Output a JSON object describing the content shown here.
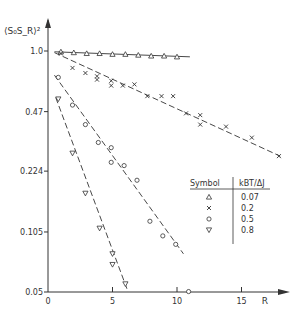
{
  "chart_data": {
    "type": "scatter",
    "title": "",
    "xlabel": "R",
    "ylabel": "<S0SR>^2",
    "ylabel_display": "⟨S₀S_R⟩²",
    "yscale": "log",
    "xlim": [
      0,
      18
    ],
    "ylim": [
      0.05,
      1.2
    ],
    "xticks": [
      0,
      5,
      10,
      15
    ],
    "yticks": [
      1.0,
      0.47,
      0.224,
      0.105,
      0.05
    ],
    "ytick_labels": [
      "1.0",
      "0.47",
      "0.224",
      "0.105",
      "0.05"
    ],
    "grid": false,
    "legend": {
      "position": "lower right",
      "header_symbol": "Symbol",
      "header_value": "kBT/ΔJ",
      "entries": [
        {
          "symbol": "△",
          "marker": "triangle-up",
          "value": "0.07"
        },
        {
          "symbol": "×",
          "marker": "x",
          "value": "0.2"
        },
        {
          "symbol": "○",
          "marker": "circle",
          "value": "0.5"
        },
        {
          "symbol": "▽",
          "marker": "triangle-down",
          "value": "0.8"
        }
      ]
    },
    "series": [
      {
        "name": "0.07",
        "marker": "triangle-up",
        "line": "solid",
        "x": [
          1,
          2,
          3,
          4,
          5,
          6,
          7,
          8,
          9,
          10
        ],
        "y": [
          0.99,
          0.98,
          0.97,
          0.97,
          0.96,
          0.96,
          0.95,
          0.94,
          0.94,
          0.93
        ],
        "fit": {
          "x": [
            0.5,
            11
          ],
          "y": [
            0.99,
            0.93
          ]
        }
      },
      {
        "name": "0.2",
        "marker": "x",
        "line": "dashed",
        "x": [
          1,
          1.9,
          2.9,
          3.8,
          3.8,
          4.9,
          4.9,
          5.8,
          6.7,
          7.7,
          8.8,
          9.7,
          10.7,
          11.8,
          11.8,
          13.8,
          15.8,
          17.9
        ],
        "y": [
          0.97,
          0.81,
          0.76,
          0.73,
          0.7,
          0.69,
          0.65,
          0.65,
          0.66,
          0.57,
          0.57,
          0.57,
          0.46,
          0.45,
          0.4,
          0.39,
          0.34,
          0.27
        ],
        "fit": {
          "x": [
            0.5,
            18
          ],
          "y": [
            0.98,
            0.27
          ]
        }
      },
      {
        "name": "0.5",
        "marker": "circle",
        "line": "dashed",
        "x": [
          0.8,
          1.9,
          2.9,
          3.9,
          4.9,
          4.9,
          5.9,
          6.9,
          7.9,
          8.9,
          9.9,
          10.9
        ],
        "y": [
          0.72,
          0.51,
          0.4,
          0.32,
          0.3,
          0.25,
          0.24,
          0.2,
          0.12,
          0.1,
          0.09,
          0.05
        ],
        "fit": {
          "x": [
            0.5,
            10.5
          ],
          "y": [
            0.74,
            0.08
          ]
        }
      },
      {
        "name": "0.8",
        "marker": "triangle-down",
        "line": "dashed",
        "x": [
          0.8,
          1.9,
          2.9,
          4.0,
          5.0,
          5.0,
          6.0
        ],
        "y": [
          0.55,
          0.28,
          0.17,
          0.11,
          0.08,
          0.07,
          0.055
        ],
        "fit": {
          "x": [
            0.6,
            6.2
          ],
          "y": [
            0.56,
            0.05
          ]
        }
      }
    ]
  }
}
